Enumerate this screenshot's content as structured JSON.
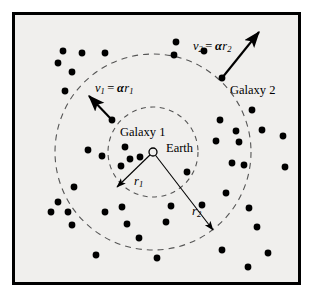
{
  "figure": {
    "background_color": "#ffffff",
    "panel_color": "#f0efed",
    "border_color": "#000000",
    "ink_color": "#000000",
    "dash_color": "#555555",
    "panel": {
      "x": 12,
      "y": 12,
      "width": 289,
      "height": 273,
      "border_width": 3
    }
  },
  "center": {
    "label": "Earth",
    "marker": "open-circle",
    "x": 153,
    "y": 152,
    "radius": 4,
    "label_x": 166,
    "label_y": 149
  },
  "circles": [
    {
      "name": "inner-orbit-circle",
      "radius_label": "r",
      "radius_subscript": "1",
      "cx": 153,
      "cy": 152,
      "r": 45
    },
    {
      "name": "outer-orbit-circle",
      "radius_label": "r",
      "radius_subscript": "2",
      "cx": 153,
      "cy": 152,
      "r": 98
    }
  ],
  "radius_arrows": [
    {
      "name": "radius-arrow-r1",
      "label": "r",
      "subscript": "1",
      "from_x": 153,
      "from_y": 152,
      "to_x": 117,
      "to_y": 187,
      "label_x": 134,
      "label_y": 182
    },
    {
      "name": "radius-arrow-r2",
      "label": "r",
      "subscript": "2",
      "from_x": 153,
      "from_y": 152,
      "to_x": 213,
      "to_y": 230,
      "label_x": 192,
      "label_y": 212
    }
  ],
  "galaxies": [
    {
      "name": "galaxy-1",
      "label": "Galaxy 1",
      "dot_x": 112,
      "dot_y": 120,
      "label_x": 120,
      "label_y": 133,
      "velocity": {
        "var": "v",
        "var_subscript": "1",
        "equals": "=",
        "alpha": "α",
        "radius": "r",
        "radius_subscript": "1",
        "formula_plain": "v1 = αr1",
        "arrow_to_x": 89,
        "arrow_to_y": 96,
        "label_x": 95,
        "label_y": 89
      }
    },
    {
      "name": "galaxy-2",
      "label": "Galaxy 2",
      "dot_x": 222,
      "dot_y": 78,
      "label_x": 230,
      "label_y": 91,
      "velocity": {
        "var": "v",
        "var_subscript": "2",
        "equals": "=",
        "alpha": "α",
        "radius": "r",
        "radius_subscript": "2",
        "formula_plain": "v2 = αr2",
        "arrow_to_x": 259,
        "arrow_to_y": 32,
        "label_x": 193,
        "label_y": 47
      }
    }
  ],
  "field_dots": [
    {
      "x": 63,
      "y": 51
    },
    {
      "x": 105,
      "y": 53
    },
    {
      "x": 58,
      "y": 63
    },
    {
      "x": 82,
      "y": 53
    },
    {
      "x": 72,
      "y": 72
    },
    {
      "x": 65,
      "y": 91
    },
    {
      "x": 176,
      "y": 42
    },
    {
      "x": 204,
      "y": 51
    },
    {
      "x": 174,
      "y": 55
    },
    {
      "x": 252,
      "y": 110
    },
    {
      "x": 220,
      "y": 120
    },
    {
      "x": 236,
      "y": 131
    },
    {
      "x": 262,
      "y": 130
    },
    {
      "x": 216,
      "y": 141
    },
    {
      "x": 239,
      "y": 142
    },
    {
      "x": 283,
      "y": 136
    },
    {
      "x": 244,
      "y": 165
    },
    {
      "x": 285,
      "y": 167
    },
    {
      "x": 125,
      "y": 147
    },
    {
      "x": 130,
      "y": 159
    },
    {
      "x": 121,
      "y": 166
    },
    {
      "x": 102,
      "y": 156
    },
    {
      "x": 140,
      "y": 157
    },
    {
      "x": 88,
      "y": 150
    },
    {
      "x": 58,
      "y": 202
    },
    {
      "x": 68,
      "y": 212
    },
    {
      "x": 51,
      "y": 212
    },
    {
      "x": 72,
      "y": 225
    },
    {
      "x": 74,
      "y": 187
    },
    {
      "x": 105,
      "y": 212
    },
    {
      "x": 122,
      "y": 207
    },
    {
      "x": 127,
      "y": 224
    },
    {
      "x": 139,
      "y": 238
    },
    {
      "x": 166,
      "y": 222
    },
    {
      "x": 96,
      "y": 255
    },
    {
      "x": 157,
      "y": 258
    },
    {
      "x": 232,
      "y": 163
    },
    {
      "x": 226,
      "y": 193
    },
    {
      "x": 249,
      "y": 208
    },
    {
      "x": 257,
      "y": 227
    },
    {
      "x": 222,
      "y": 250
    },
    {
      "x": 248,
      "y": 267
    },
    {
      "x": 268,
      "y": 253
    },
    {
      "x": 171,
      "y": 206
    },
    {
      "x": 202,
      "y": 205
    },
    {
      "x": 187,
      "y": 172
    }
  ]
}
